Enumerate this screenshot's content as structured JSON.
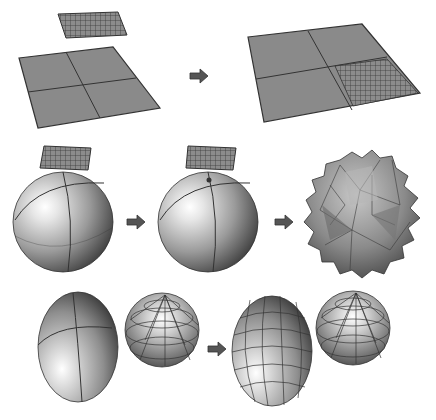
{
  "diagram": {
    "colors": {
      "background": "#ffffff",
      "surface": "#8a8a8a",
      "edge": "#333333",
      "arrow": "#555555",
      "sphere_light": "#f2f2f2",
      "sphere_dark": "#444444"
    },
    "rows": [
      {
        "name": "plane-transfer",
        "before": [
          "fine-grid-patch",
          "coarse-plane-2x2"
        ],
        "after": [
          "coarse-plane-2x2-with-refined-quadrant"
        ],
        "arrow": "arrow-right"
      },
      {
        "name": "sphere-transfer",
        "before": [
          "fine-grid-patch",
          "smooth-sphere"
        ],
        "middle": [
          "fine-grid-patch",
          "smooth-sphere-with-contact-point"
        ],
        "after": [
          "spiky-distorted-sphere"
        ],
        "arrows": [
          "arrow-right",
          "arrow-right"
        ]
      },
      {
        "name": "ellipsoid-transfer",
        "before": [
          "smooth-ellipsoid",
          "faceted-sphere-mesh"
        ],
        "after": [
          "faceted-ellipsoid-mesh",
          "faceted-sphere-mesh"
        ],
        "arrow": "arrow-right"
      }
    ]
  }
}
